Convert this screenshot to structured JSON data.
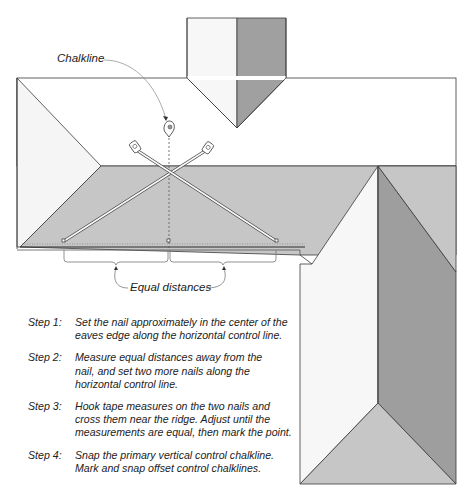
{
  "labels": {
    "chalkline": "Chalkline",
    "equal_distances": "Equal distances"
  },
  "steps": [
    {
      "num": "Step 1:",
      "lines": [
        "Set the nail approximately in the center of the",
        "eaves edge along the horizontal control line."
      ]
    },
    {
      "num": "Step 2:",
      "lines": [
        "Measure equal distances away from the",
        "nail, and set two more nails along the",
        "horizontal control line."
      ]
    },
    {
      "num": "Step 3:",
      "lines": [
        "Hook tape measures on the two nails and",
        "cross them near the ridge. Adjust until the",
        "measurements are equal, then mark the point."
      ]
    },
    {
      "num": "Step 4:",
      "lines": [
        "Snap the primary vertical control chalkline.",
        "Mark and snap offset control chalklines."
      ]
    }
  ],
  "colors": {
    "light_face": "#f7f7f7",
    "mid_face": "#c9c9c9",
    "dark_face": "#9c9c9c",
    "roof_plane": "#c4c4c4",
    "outline": "#3a3a3a"
  }
}
